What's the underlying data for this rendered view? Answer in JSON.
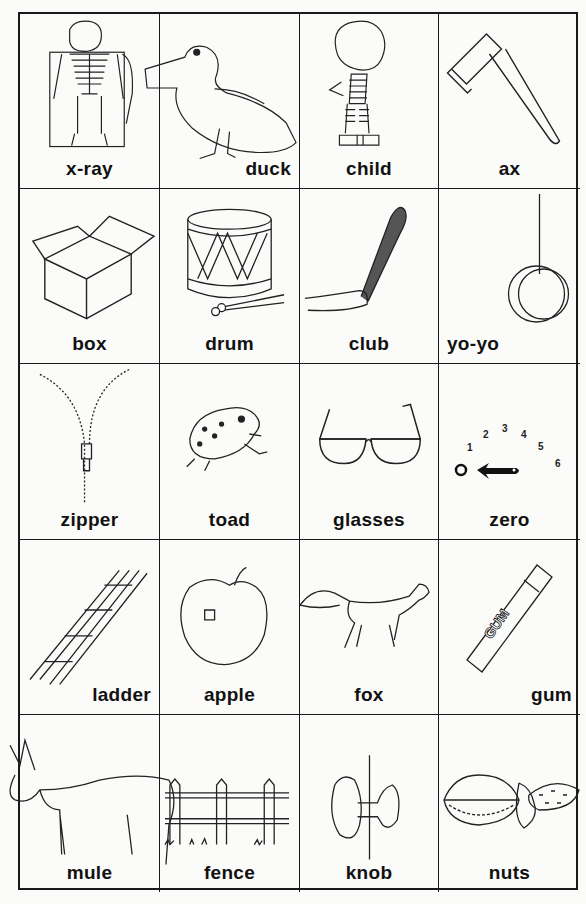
{
  "worksheet": {
    "cards": [
      {
        "word": "x-ray",
        "picture": "skeleton-xray-icon"
      },
      {
        "word": "duck",
        "picture": "duck-icon"
      },
      {
        "word": "child",
        "picture": "child-icon"
      },
      {
        "word": "ax",
        "picture": "ax-icon"
      },
      {
        "word": "box",
        "picture": "box-icon"
      },
      {
        "word": "drum",
        "picture": "drum-icon"
      },
      {
        "word": "club",
        "picture": "club-icon"
      },
      {
        "word": "yo-yo",
        "picture": "yoyo-icon"
      },
      {
        "word": "zipper",
        "picture": "zipper-icon"
      },
      {
        "word": "toad",
        "picture": "toad-icon"
      },
      {
        "word": "glasses",
        "picture": "glasses-icon"
      },
      {
        "word": "zero",
        "picture": "dial-zero-icon",
        "dial_numbers": [
          "0",
          "1",
          "2",
          "3",
          "4",
          "5",
          "6"
        ]
      },
      {
        "word": "ladder",
        "picture": "ladder-icon"
      },
      {
        "word": "apple",
        "picture": "apple-icon"
      },
      {
        "word": "fox",
        "picture": "fox-icon"
      },
      {
        "word": "gum",
        "picture": "gum-icon",
        "gum_text": "GUM"
      },
      {
        "word": "mule",
        "picture": "mule-icon"
      },
      {
        "word": "fence",
        "picture": "fence-icon"
      },
      {
        "word": "knob",
        "picture": "knob-icon"
      },
      {
        "word": "nuts",
        "picture": "nuts-icon"
      }
    ]
  }
}
